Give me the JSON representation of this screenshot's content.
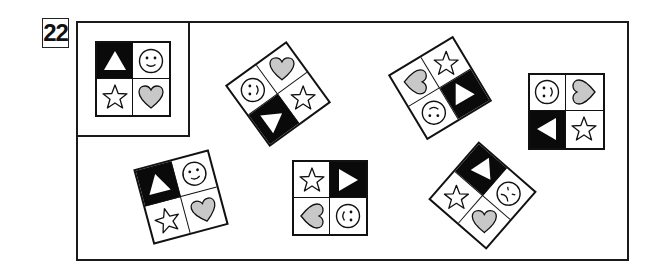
{
  "question_number": "22",
  "colors": {
    "ink": "#111111",
    "heart_fill": "#c8c8c8",
    "black_cell": "#0a0a0a",
    "background": "#ffffff"
  },
  "reference_tile": {
    "cells": {
      "tl": "triangle-up-black",
      "tr": "smiley",
      "bl": "star",
      "br": "heart"
    }
  },
  "tiles": [
    {
      "id": "reference",
      "cx": 133,
      "cy": 79,
      "size": 76,
      "rotation": 0,
      "cells": [
        {
          "pos": "tl",
          "shape": "triangle",
          "black": true,
          "rot": 0
        },
        {
          "pos": "tr",
          "shape": "smiley",
          "black": false,
          "rot": 0
        },
        {
          "pos": "bl",
          "shape": "star",
          "black": false,
          "rot": 0
        },
        {
          "pos": "br",
          "shape": "heart",
          "black": false,
          "rot": 0
        }
      ]
    },
    {
      "id": "option-1",
      "cx": 278,
      "cy": 94,
      "size": 76,
      "rotation": -36,
      "cells": [
        {
          "pos": "tl",
          "shape": "smiley",
          "black": false,
          "rot": -54
        },
        {
          "pos": "tr",
          "shape": "heart",
          "black": false,
          "rot": 36
        },
        {
          "pos": "bl",
          "shape": "triangle",
          "black": true,
          "rot": 90
        },
        {
          "pos": "br",
          "shape": "star",
          "black": false,
          "rot": 36
        }
      ]
    },
    {
      "id": "option-2",
      "cx": 440,
      "cy": 88,
      "size": 76,
      "rotation": -31,
      "cells": [
        {
          "pos": "tl",
          "shape": "heart",
          "black": false,
          "rot": 121
        },
        {
          "pos": "tr",
          "shape": "star",
          "black": false,
          "rot": 31
        },
        {
          "pos": "bl",
          "shape": "smiley",
          "black": false,
          "rot": 211
        },
        {
          "pos": "br",
          "shape": "triangle",
          "black": true,
          "rot": 121
        }
      ]
    },
    {
      "id": "option-3",
      "cx": 566,
      "cy": 111,
      "size": 77,
      "rotation": 0,
      "cells": [
        {
          "pos": "tl",
          "shape": "smiley",
          "black": false,
          "rot": -90
        },
        {
          "pos": "tr",
          "shape": "heart",
          "black": false,
          "rot": -90
        },
        {
          "pos": "bl",
          "shape": "triangle",
          "black": true,
          "rot": -90
        },
        {
          "pos": "br",
          "shape": "star",
          "black": false,
          "rot": 0
        }
      ]
    },
    {
      "id": "option-4",
      "cx": 181,
      "cy": 197,
      "size": 78,
      "rotation": -15,
      "cells": [
        {
          "pos": "tl",
          "shape": "triangle",
          "black": true,
          "rot": 0
        },
        {
          "pos": "tr",
          "shape": "smiley",
          "black": false,
          "rot": 0
        },
        {
          "pos": "bl",
          "shape": "star",
          "black": false,
          "rot": 0
        },
        {
          "pos": "br",
          "shape": "heart",
          "black": false,
          "rot": 0
        }
      ]
    },
    {
      "id": "option-5",
      "cx": 330,
      "cy": 198,
      "size": 76,
      "rotation": 0,
      "cells": [
        {
          "pos": "tl",
          "shape": "star",
          "black": false,
          "rot": 0
        },
        {
          "pos": "tr",
          "shape": "triangle",
          "black": true,
          "rot": 90
        },
        {
          "pos": "bl",
          "shape": "heart",
          "black": false,
          "rot": 90
        },
        {
          "pos": "br",
          "shape": "smiley",
          "black": false,
          "rot": 90
        }
      ]
    },
    {
      "id": "option-6",
      "cx": 482,
      "cy": 195,
      "size": 77,
      "rotation": -49,
      "cells": [
        {
          "pos": "tl",
          "shape": "star",
          "black": false,
          "rot": 49
        },
        {
          "pos": "tr",
          "shape": "triangle",
          "black": true,
          "rot": -45
        },
        {
          "pos": "bl",
          "shape": "heart",
          "black": false,
          "rot": 49
        },
        {
          "pos": "br",
          "shape": "frown",
          "black": false,
          "rot": 95
        }
      ]
    }
  ]
}
